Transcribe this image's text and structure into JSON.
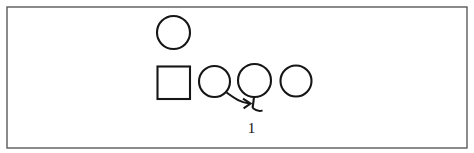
{
  "figure": {
    "background_color": "#ffffff",
    "line_color": "#161616",
    "frame_color": "#5a5a5a",
    "label_color": "#121212",
    "frame": {
      "x": 7,
      "y": 7,
      "width": 460,
      "height": 141
    },
    "nodes": [
      {
        "id": "circle-top",
        "name": "circle-node-top",
        "shape": "circle",
        "cx": 173.5,
        "cy": 32.5,
        "r": 16.5
      },
      {
        "id": "square-left",
        "name": "square-node",
        "shape": "square",
        "x": 157.5,
        "y": 66.5,
        "width": 32.5,
        "height": 32.5
      },
      {
        "id": "circle-row-1",
        "name": "circle-node-row-1",
        "shape": "circle",
        "cx": 214.5,
        "cy": 81.5,
        "r": 15.5
      },
      {
        "id": "circle-row-2",
        "name": "circle-node-row-2",
        "shape": "circle",
        "cx": 254.5,
        "cy": 80.5,
        "r": 16.5
      },
      {
        "id": "circle-row-3",
        "name": "circle-node-row-3",
        "shape": "circle",
        "cx": 296.0,
        "cy": 81.0,
        "r": 15.5
      }
    ],
    "connectors": [
      {
        "id": "curve-arrow",
        "name": "curved-arrow-connector",
        "type": "curve-with-arrowhead",
        "path": "M 226.5 92.5 C 236.5 99.5, 240.5 102.5, 249.5 103.5",
        "arrowhead": "M 243.0 98.6 L 250.5 103.6 L 243.6 108.4"
      },
      {
        "id": "stem-hook",
        "name": "stem-hook-connector",
        "type": "line-with-hook",
        "path": "M 254.0 97.0 L 252.6 108.0",
        "hook": "M 252.6 108.0 C 256.5 111.0, 259.5 111.8, 262.5 110.4"
      }
    ],
    "labels": [
      {
        "id": "label-1",
        "name": "generation-label",
        "text": "1",
        "x": 251.5,
        "y": 133.0
      }
    ]
  }
}
